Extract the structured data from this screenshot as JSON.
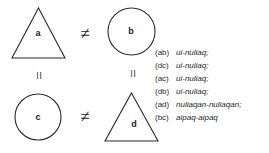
{
  "figure": {
    "type": "relation-diagram",
    "background_color": "#ffffff",
    "stroke_color": "#2b2b2b"
  },
  "nodes": [
    {
      "id": "a",
      "label": "a",
      "shape": "triangle",
      "position": "top-left"
    },
    {
      "id": "b",
      "label": "b",
      "shape": "circle",
      "position": "top-right"
    },
    {
      "id": "c",
      "label": "c",
      "shape": "circle",
      "position": "bottom-left"
    },
    {
      "id": "d",
      "label": "d",
      "shape": "triangle",
      "position": "bottom-right"
    }
  ],
  "relations": [
    {
      "id": "a-b",
      "symbol": "≠",
      "name": "not-equal",
      "orientation": "horizontal",
      "between": "a,b"
    },
    {
      "id": "c-d",
      "symbol": "≠",
      "name": "not-equal",
      "orientation": "horizontal",
      "between": "c,d"
    },
    {
      "id": "a-c",
      "symbol": "=",
      "name": "equal",
      "orientation": "vertical",
      "between": "a,c"
    },
    {
      "id": "b-d",
      "symbol": "=",
      "name": "equal",
      "orientation": "vertical",
      "between": "b,d"
    }
  ],
  "gloss_list": [
    {
      "key": "(ab)",
      "form": "ui-nuliaq;"
    },
    {
      "key": "(dc)",
      "form": "ui-nuliaq;"
    },
    {
      "key": "(ac)",
      "form": "ui-nuliaq;"
    },
    {
      "key": "(db)",
      "form": "ui-nuliaq;"
    },
    {
      "key": "(ad)",
      "form": "nuliaqan-nuliaqan;"
    },
    {
      "key": "(bc)",
      "form": "aipaq-aipaq"
    }
  ]
}
